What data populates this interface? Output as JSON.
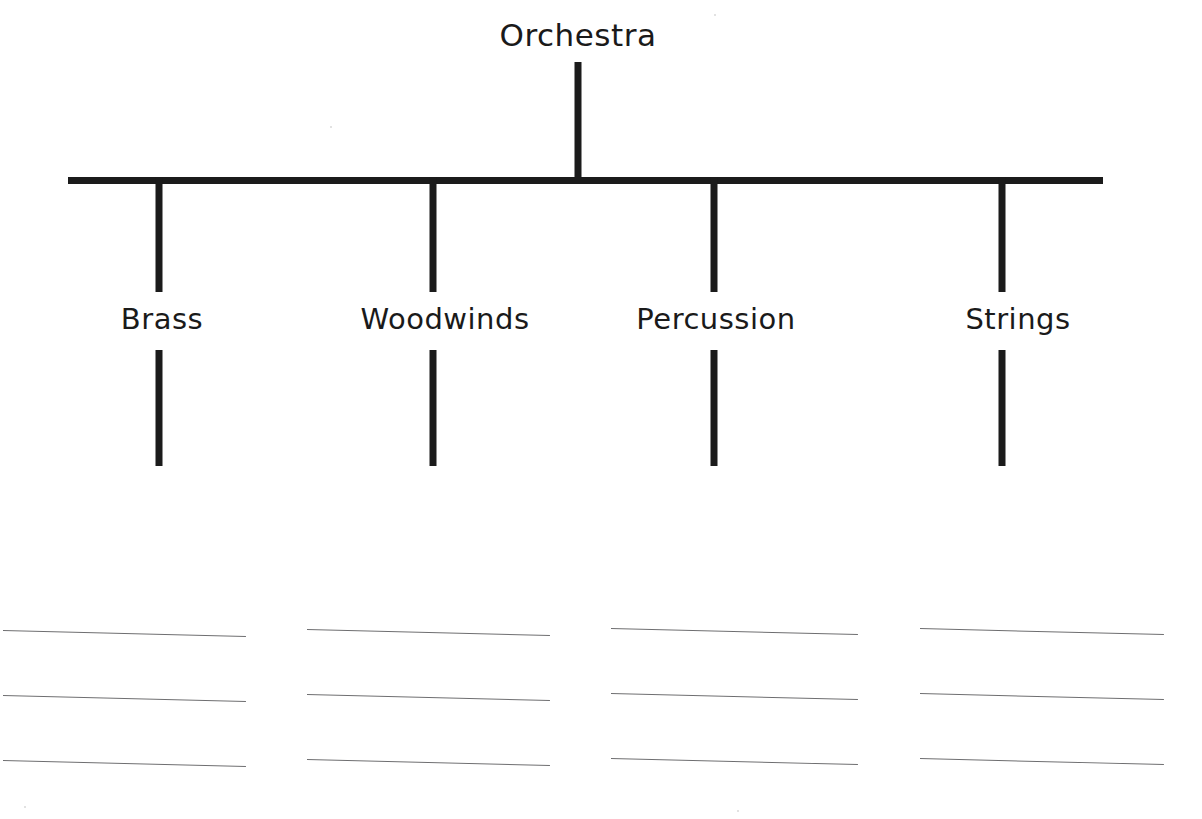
{
  "worksheet": {
    "title": "Orchestra",
    "background_color": "#ffffff",
    "ink_color": "#1b1b1b",
    "rule_color": "#6e6e70"
  },
  "tree": {
    "root": {
      "label": "Orchestra",
      "center_x": 578,
      "label_top": 17,
      "stem": {
        "x": 578,
        "top": 62,
        "height": 118
      }
    },
    "connector_bar": {
      "name": "horizontal-connector",
      "left": 68,
      "right": 1103,
      "y": 177,
      "thickness": 7
    },
    "children": [
      {
        "label": "Brass",
        "stem_x": 159,
        "label_center_x": 162,
        "upper_stem": {
          "top": 177,
          "height": 115
        },
        "lower_stem": {
          "top": 350,
          "height": 116
        }
      },
      {
        "label": "Woodwinds",
        "stem_x": 433,
        "label_center_x": 445,
        "upper_stem": {
          "top": 177,
          "height": 115
        },
        "lower_stem": {
          "top": 350,
          "height": 116
        }
      },
      {
        "label": "Percussion",
        "stem_x": 714,
        "label_center_x": 716,
        "upper_stem": {
          "top": 177,
          "height": 115
        },
        "lower_stem": {
          "top": 350,
          "height": 116
        }
      },
      {
        "label": "Strings",
        "stem_x": 1002,
        "label_center_x": 1018,
        "upper_stem": {
          "top": 177,
          "height": 115
        },
        "lower_stem": {
          "top": 350,
          "height": 116
        }
      }
    ]
  },
  "answer_lines": {
    "description": "Blank ruled writing lines, three per family column",
    "rows_per_column": 3,
    "row_spacing": 65,
    "first_row_y": 630,
    "tilt_px": 6,
    "columns": [
      {
        "for": "Brass",
        "left": 3,
        "width": 243
      },
      {
        "for": "Woodwinds",
        "left": 307,
        "width": 243
      },
      {
        "for": "Percussion",
        "left": 611,
        "width": 247
      },
      {
        "for": "Strings",
        "left": 920,
        "width": 244
      }
    ]
  }
}
